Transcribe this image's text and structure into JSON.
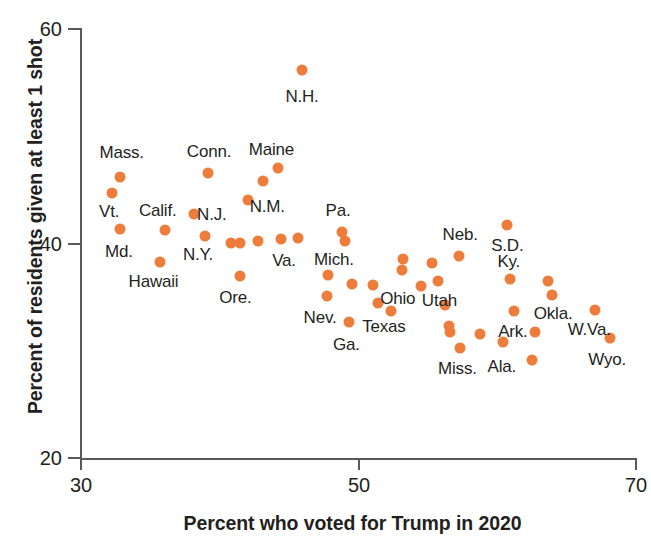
{
  "chart_data": {
    "type": "scatter",
    "title": "",
    "xlabel": "Percent who voted for Trump in 2020",
    "ylabel": "Percent of residents given at least 1 shot",
    "xlim": [
      30,
      70
    ],
    "ylim": [
      20,
      60
    ],
    "xticks": [
      "30",
      "50",
      "70"
    ],
    "yticks": [
      "60",
      "40",
      "20"
    ],
    "grid": false,
    "legend": null,
    "marker_color": "#ee7d3b",
    "axis_color": "#58595b",
    "points": [
      {
        "label": "N.H.",
        "x": 46.0,
        "y": 56.1
      },
      {
        "label": "Mass.",
        "x": 32.9,
        "y": 46.1
      },
      {
        "label": "Conn.",
        "x": 39.2,
        "y": 46.5
      },
      {
        "label": "Maine",
        "x": 44.3,
        "y": 46.9
      },
      {
        "label": "",
        "x": 43.2,
        "y": 45.7
      },
      {
        "label": "Vt.",
        "x": 32.3,
        "y": 44.6
      },
      {
        "label": "N.M.",
        "x": 42.1,
        "y": 44.0
      },
      {
        "label": "N.J.",
        "x": 38.2,
        "y": 42.7
      },
      {
        "label": "Md.",
        "x": 32.9,
        "y": 41.3
      },
      {
        "label": "Calif.",
        "x": 36.1,
        "y": 41.2
      },
      {
        "label": "N.Y.",
        "x": 39.0,
        "y": 40.6
      },
      {
        "label": "",
        "x": 40.9,
        "y": 40.0
      },
      {
        "label": "",
        "x": 41.5,
        "y": 40.0
      },
      {
        "label": "",
        "x": 42.8,
        "y": 40.1
      },
      {
        "label": "Va.",
        "x": 44.5,
        "y": 40.3
      },
      {
        "label": "",
        "x": 45.7,
        "y": 40.4
      },
      {
        "label": "Pa.",
        "x": 48.9,
        "y": 41.0
      },
      {
        "label": "",
        "x": 49.1,
        "y": 40.1
      },
      {
        "label": "Hawaii",
        "x": 35.8,
        "y": 38.2
      },
      {
        "label": "Ore.",
        "x": 41.5,
        "y": 36.9
      },
      {
        "label": "Mich.",
        "x": 47.9,
        "y": 37.0
      },
      {
        "label": "Nev.",
        "x": 47.8,
        "y": 35.0
      },
      {
        "label": "",
        "x": 49.6,
        "y": 36.1
      },
      {
        "label": "",
        "x": 51.1,
        "y": 36.0
      },
      {
        "label": "Ga.",
        "x": 49.4,
        "y": 32.6
      },
      {
        "label": "",
        "x": 51.5,
        "y": 34.4
      },
      {
        "label": "Ohio",
        "x": 53.3,
        "y": 38.5
      },
      {
        "label": "",
        "x": 53.2,
        "y": 37.4
      },
      {
        "label": "Texas",
        "x": 52.4,
        "y": 33.6
      },
      {
        "label": "",
        "x": 54.6,
        "y": 35.9
      },
      {
        "label": "",
        "x": 55.4,
        "y": 38.1
      },
      {
        "label": "Neb.",
        "x": 57.3,
        "y": 38.7
      },
      {
        "label": "Utah",
        "x": 55.8,
        "y": 36.4
      },
      {
        "label": "",
        "x": 56.3,
        "y": 34.2
      },
      {
        "label": "",
        "x": 56.6,
        "y": 32.2
      },
      {
        "label": "",
        "x": 56.7,
        "y": 31.7
      },
      {
        "label": "Miss.",
        "x": 57.4,
        "y": 30.2
      },
      {
        "label": "S.D.",
        "x": 60.8,
        "y": 41.6
      },
      {
        "label": "Ky.",
        "x": 61.0,
        "y": 36.6
      },
      {
        "label": "Ark.",
        "x": 61.3,
        "y": 33.6
      },
      {
        "label": "",
        "x": 58.8,
        "y": 31.5
      },
      {
        "label": "Ala.",
        "x": 60.5,
        "y": 30.7
      },
      {
        "label": "Okla.",
        "x": 63.7,
        "y": 36.4
      },
      {
        "label": "",
        "x": 64.0,
        "y": 35.1
      },
      {
        "label": "",
        "x": 62.8,
        "y": 31.7
      },
      {
        "label": "W.Va.",
        "x": 67.1,
        "y": 33.7
      },
      {
        "label": "Wyo.",
        "x": 68.2,
        "y": 31.1
      },
      {
        "label": "",
        "x": 62.6,
        "y": 29.0
      }
    ],
    "annotations": [
      {
        "text": "N.H.",
        "x": 46.0,
        "y": 53.6
      },
      {
        "text": "Mass.",
        "x": 33.0,
        "y": 48.3
      },
      {
        "text": "Conn.",
        "x": 39.3,
        "y": 48.4
      },
      {
        "text": "Maine",
        "x": 43.8,
        "y": 48.6
      },
      {
        "text": "Vt.",
        "x": 32.1,
        "y": 42.8
      },
      {
        "text": "N.M.",
        "x": 43.5,
        "y": 43.3
      },
      {
        "text": "Calif.",
        "x": 35.6,
        "y": 42.9
      },
      {
        "text": "N.J.",
        "x": 39.5,
        "y": 42.6
      },
      {
        "text": "Md.",
        "x": 32.8,
        "y": 39.1
      },
      {
        "text": "N.Y.",
        "x": 38.5,
        "y": 38.8
      },
      {
        "text": "Pa.",
        "x": 48.6,
        "y": 42.9
      },
      {
        "text": "Va.",
        "x": 44.7,
        "y": 38.3
      },
      {
        "text": "Mich.",
        "x": 48.3,
        "y": 38.4
      },
      {
        "text": "Hawaii",
        "x": 35.3,
        "y": 36.3
      },
      {
        "text": "Ore.",
        "x": 41.2,
        "y": 34.8
      },
      {
        "text": "Nev.",
        "x": 47.3,
        "y": 33.0
      },
      {
        "text": "Ohio",
        "x": 52.9,
        "y": 34.7
      },
      {
        "text": "Texas",
        "x": 51.9,
        "y": 32.1
      },
      {
        "text": "Ga.",
        "x": 49.2,
        "y": 30.4
      },
      {
        "text": "Neb.",
        "x": 57.4,
        "y": 40.7
      },
      {
        "text": "Utah",
        "x": 55.9,
        "y": 34.5
      },
      {
        "text": "Miss.",
        "x": 57.2,
        "y": 28.2
      },
      {
        "text": "S.D.",
        "x": 60.8,
        "y": 39.7
      },
      {
        "text": "Ky.",
        "x": 60.9,
        "y": 38.2
      },
      {
        "text": "Ark.",
        "x": 61.2,
        "y": 31.7
      },
      {
        "text": "Ala.",
        "x": 60.4,
        "y": 28.4
      },
      {
        "text": "Okla.",
        "x": 64.1,
        "y": 33.3
      },
      {
        "text": "W.Va.",
        "x": 66.7,
        "y": 31.8
      },
      {
        "text": "Wyo.",
        "x": 68.0,
        "y": 29.0
      }
    ]
  }
}
